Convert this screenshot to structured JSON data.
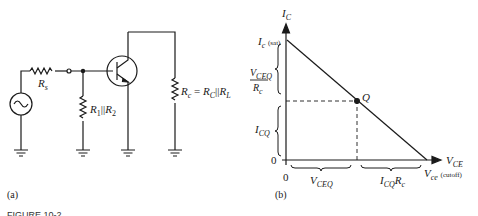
{
  "figure_caption": "FIGURE 10-2",
  "panel_a": {
    "label": "(a)",
    "source_resistor": {
      "name": "R",
      "sub": "s"
    },
    "bias_resistor": {
      "name": "R",
      "sub1": "1",
      "sep": "||",
      "name2": "R",
      "sub2": "2"
    },
    "load_resistor": {
      "name": "R",
      "sub": "c",
      "eq": " = ",
      "name2": "R",
      "sub2": "C",
      "sep": "||",
      "name3": "R",
      "sub3": "L"
    }
  },
  "panel_b": {
    "label": "(b)",
    "y_axis_label": {
      "name": "I",
      "sub": "C"
    },
    "x_axis_label": {
      "name": "V",
      "sub": "CE"
    },
    "ic_sat": {
      "name": "I",
      "sub": "c",
      "suffix": "(sat)"
    },
    "vce_cutoff": {
      "name": "V",
      "sub": "ce",
      "suffix": "(cutoff)"
    },
    "fraction_num": {
      "name": "V",
      "sub": "CEQ"
    },
    "fraction_den": {
      "name": "R",
      "sub": "c"
    },
    "icq": {
      "name": "I",
      "sub": "CQ"
    },
    "vceq": {
      "name": "V",
      "sub": "CEQ"
    },
    "icq_rc": {
      "name": "I",
      "sub": "CQ",
      "name2": "R",
      "sub2": "c"
    },
    "q_point": "Q",
    "origin_y": "0",
    "origin_x": "0"
  }
}
